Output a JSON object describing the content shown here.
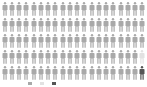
{
  "chart_data": {
    "type": "pictogram",
    "title": "",
    "grid": {
      "rows": 5,
      "cols": 20,
      "total": 100
    },
    "series": [
      {
        "name": "category-a",
        "count": 98,
        "color": "#a9a9a9"
      },
      {
        "name": "category-b",
        "count": 1,
        "color": "#e2e2e2"
      },
      {
        "name": "category-c",
        "count": 1,
        "color": "#555555"
      }
    ],
    "cells": [
      "a",
      "a",
      "a",
      "a",
      "a",
      "a",
      "a",
      "a",
      "a",
      "a",
      "a",
      "a",
      "a",
      "a",
      "a",
      "a",
      "a",
      "a",
      "a",
      "a",
      "a",
      "a",
      "a",
      "a",
      "a",
      "a",
      "a",
      "a",
      "a",
      "a",
      "a",
      "a",
      "a",
      "a",
      "a",
      "a",
      "a",
      "a",
      "a",
      "a",
      "a",
      "a",
      "a",
      "a",
      "a",
      "a",
      "a",
      "a",
      "a",
      "a",
      "a",
      "a",
      "a",
      "a",
      "a",
      "a",
      "a",
      "a",
      "a",
      "a",
      "a",
      "a",
      "a",
      "a",
      "a",
      "a",
      "a",
      "a",
      "a",
      "a",
      "a",
      "a",
      "a",
      "a",
      "a",
      "a",
      "a",
      "a",
      "a",
      "b",
      "a",
      "a",
      "a",
      "a",
      "a",
      "a",
      "a",
      "a",
      "a",
      "a",
      "a",
      "a",
      "a",
      "a",
      "a",
      "a",
      "a",
      "a",
      "a",
      "c"
    ],
    "legend": {
      "position": "bottom",
      "entries": [
        "",
        "",
        ""
      ]
    }
  },
  "colors": {
    "a": "#a9a9a9",
    "b": "#e2e2e2",
    "c": "#555555"
  }
}
